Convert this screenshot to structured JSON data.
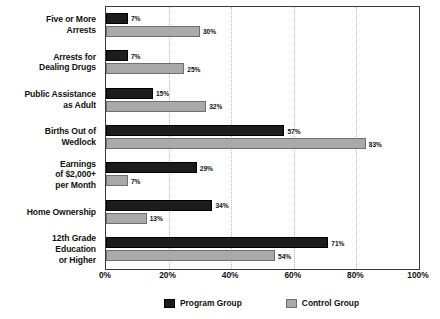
{
  "chart_data": {
    "type": "bar",
    "orientation": "horizontal",
    "title": "",
    "xlabel": "",
    "ylabel": "",
    "xlim": [
      0,
      100
    ],
    "grid": true,
    "grid_axis": "x",
    "legend_position": "bottom",
    "value_label_suffix": "%",
    "categories": [
      "Five or More\nArrests",
      "Arrests for\nDealing Drugs",
      "Public Assistance\nas Adult",
      "Births Out of\nWedlock",
      "Earnings\nof $2,000+\nper Month",
      "Home Ownership",
      "12th Grade\nEducation\nor Higher"
    ],
    "category_lines": [
      [
        "Five or More",
        "Arrests"
      ],
      [
        "Arrests for",
        "Dealing Drugs"
      ],
      [
        "Public Assistance",
        "as Adult"
      ],
      [
        "Births Out of",
        "Wedlock"
      ],
      [
        "Earnings",
        "of $2,000+",
        "per Month"
      ],
      [
        "Home Ownership"
      ],
      [
        "12th Grade",
        "Education",
        "or Higher"
      ]
    ],
    "series": [
      {
        "name": "Program Group",
        "color": "#1c1c1c",
        "values": [
          7,
          7,
          15,
          57,
          29,
          34,
          71
        ],
        "labels": [
          "7%",
          "7%",
          "15%",
          "57%",
          "29%",
          "34%",
          "71%"
        ]
      },
      {
        "name": "Control Group",
        "color": "#a9a9a9",
        "values": [
          30,
          25,
          32,
          83,
          7,
          13,
          54
        ],
        "labels": [
          "30%",
          "25%",
          "32%",
          "83%",
          "7%",
          "13%",
          "54%"
        ]
      }
    ],
    "xticks": [
      0,
      20,
      40,
      60,
      80,
      100
    ],
    "xtick_labels": [
      "0%",
      "20%",
      "40%",
      "60%",
      "80%",
      "100%"
    ]
  },
  "legend": {
    "items": [
      {
        "label": "Program Group",
        "key": "program"
      },
      {
        "label": "Control Group",
        "key": "control"
      }
    ]
  }
}
